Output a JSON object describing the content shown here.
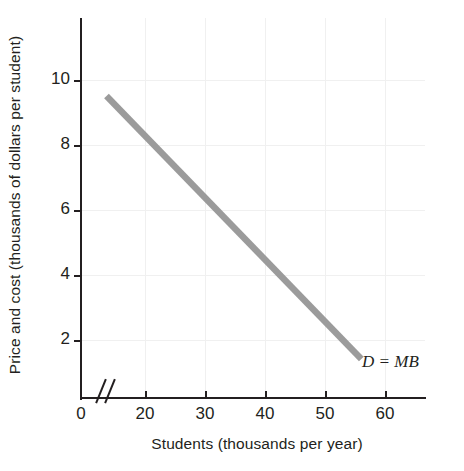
{
  "chart_data": {
    "type": "line",
    "title": "",
    "xlabel": "Students (thousands per year)",
    "ylabel": "Price and cost (thousands of dollars per student)",
    "xlim": [
      10,
      64
    ],
    "ylim": [
      0,
      11.7
    ],
    "xticks": [
      "0",
      "20",
      "30",
      "40",
      "50",
      "60"
    ],
    "yticks": [
      "0",
      "2",
      "4",
      "6",
      "8",
      "10"
    ],
    "grid": true,
    "axis_break": "//",
    "legend_position": "inline-annotation",
    "series": [
      {
        "name": "D = MB",
        "label": "D = MB",
        "color": "#9b9b9b",
        "x": [
          14,
          54
        ],
        "y": [
          9.3,
          1.2
        ],
        "points": [
          {
            "x": 14,
            "y": 9.3
          },
          {
            "x": 20,
            "y": 8.1
          },
          {
            "x": 30,
            "y": 6.1
          },
          {
            "x": 40,
            "y": 4.1
          },
          {
            "x": 50,
            "y": 2.1
          },
          {
            "x": 54,
            "y": 1.2
          }
        ]
      }
    ],
    "annotations": [
      {
        "text": "D = MB",
        "x": 56,
        "y": 1.4,
        "style": "italic"
      }
    ]
  },
  "axes": {
    "y_title": "Price and cost (thousands of dollars per student)",
    "x_title": "Students (thousands per year)",
    "y_tick_labels": [
      "10",
      "8",
      "6",
      "4",
      "2",
      "0"
    ],
    "x_tick_labels": [
      "0",
      "20",
      "30",
      "40",
      "50",
      "60"
    ]
  },
  "curve": {
    "label": "D = MB",
    "color": "#9b9b9b"
  },
  "colors": {
    "curve": "#9b9b9b",
    "axis": "#231f20",
    "grid": "#f0f0f0",
    "background": "#ffffff",
    "text": "#231f20"
  }
}
